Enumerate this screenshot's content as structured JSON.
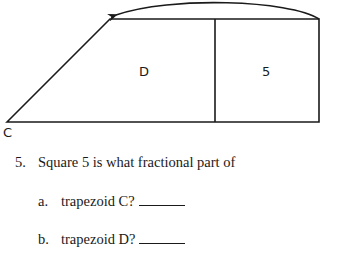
{
  "diagram": {
    "region_d_label": "D",
    "square_label": "5",
    "corner_label": "C",
    "stroke_color": "#1a1a1a"
  },
  "question": {
    "number": "5.",
    "prompt": "Square 5 is what fractional part of",
    "parts": [
      {
        "letter": "a.",
        "text": "trapezoid C?"
      },
      {
        "letter": "b.",
        "text": "trapezoid D?"
      }
    ]
  }
}
